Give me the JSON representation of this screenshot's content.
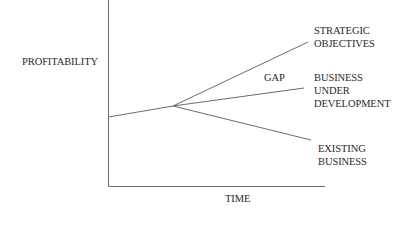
{
  "diagram": {
    "y_axis_label": "PROFITABILITY",
    "x_axis_label": "TIME",
    "gap_label": "GAP",
    "branches": [
      {
        "id": "strategic",
        "lines": [
          "STRATEGIC",
          "OBJECTIVES"
        ]
      },
      {
        "id": "development",
        "lines": [
          "BUSINESS",
          "UNDER",
          "DEVELOPMENT"
        ]
      },
      {
        "id": "existing",
        "lines": [
          "EXISTING",
          "BUSINESS"
        ]
      }
    ],
    "colors": {
      "line": "#6b6b6b",
      "text": "#2a2a2a",
      "background": "#ffffff"
    }
  }
}
